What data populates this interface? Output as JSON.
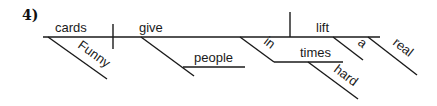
{
  "item_number": "4)",
  "words": {
    "subject": "cards",
    "subject_modifier": "Funny",
    "verb1": "give",
    "indirect_object": "people",
    "preposition": "in",
    "prep_object": "times",
    "prep_object_modifier": "hard",
    "verb2": "lift",
    "article": "a",
    "adjective": "real"
  }
}
